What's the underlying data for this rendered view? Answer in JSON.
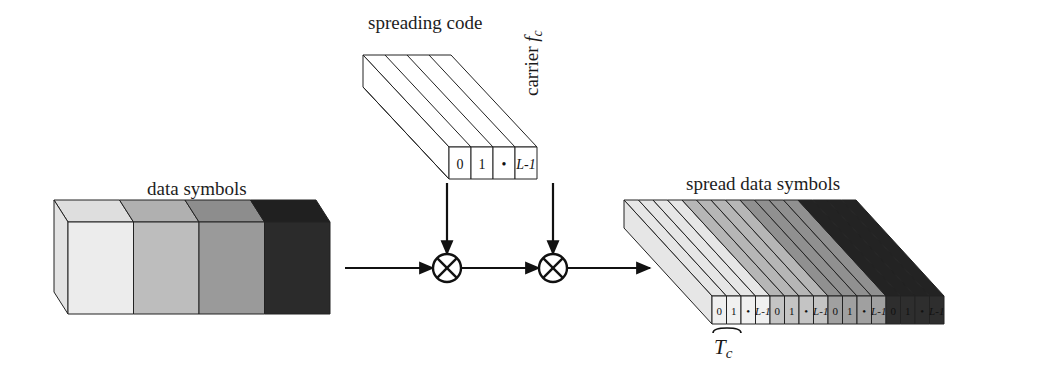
{
  "diagram": {
    "type": "ds-cdma-spreading-block-diagram",
    "background": "#ffffff",
    "stroke": "#222222"
  },
  "labels": {
    "data_symbols": "data symbols",
    "spreading_code": "spreading code",
    "spread_data_symbols": "spread data symbols",
    "carrier_prefix": "carrier ",
    "carrier_symbol": "f",
    "carrier_subscript": "c",
    "chip_duration_symbol": "T",
    "chip_duration_subscript": "c"
  },
  "data_symbols_block": {
    "segment_count": 4,
    "front_fills": [
      "#ececec",
      "#bdbdbd",
      "#9a9a9a",
      "#2b2b2b"
    ],
    "top_fills": [
      "#dedede",
      "#b0b0b0",
      "#8d8d8d",
      "#202020"
    ],
    "side_fill": "#e3e3e3"
  },
  "spreading_code_block": {
    "chip_count": 4,
    "chip_labels": [
      "0",
      "1",
      "•",
      "L-1"
    ],
    "italic_flags": [
      false,
      false,
      false,
      true
    ],
    "front_fill": "#ffffff",
    "top_fill": "#ffffff",
    "side_fill": "#ffffff"
  },
  "spread_block": {
    "group_count": 4,
    "chips_per_group": 4,
    "chip_labels": [
      "0",
      "1",
      "•",
      "L-1"
    ],
    "italic_flags": [
      false,
      false,
      false,
      true
    ],
    "group_front_fills": [
      "#f0f0f0",
      "#c4c4c4",
      "#a0a0a0",
      "#2e2e2e"
    ],
    "group_top_fills": [
      "#e6e6e6",
      "#b6b6b6",
      "#909090",
      "#232323"
    ],
    "total_chips": 16
  },
  "multipliers": [
    {
      "id": "mult-spreading",
      "glyph": "⊗",
      "cx": 447,
      "cy": 268,
      "r": 14
    },
    {
      "id": "mult-carrier",
      "glyph": "⊗",
      "cx": 553,
      "cy": 268,
      "r": 14
    }
  ],
  "signal_flow": {
    "horizontal_y": 268,
    "segments": [
      {
        "name": "data-to-mult1",
        "x1": 345,
        "x2": 433
      },
      {
        "name": "mult1-to-mult2",
        "x1": 461,
        "x2": 539
      },
      {
        "name": "mult2-to-spread",
        "x1": 567,
        "x2": 650
      }
    ],
    "vertical_inputs": [
      {
        "name": "spreading-code-input",
        "x": 447,
        "y1": 183,
        "y2": 254
      },
      {
        "name": "carrier-input",
        "x": 553,
        "y1": 183,
        "y2": 254
      }
    ]
  }
}
